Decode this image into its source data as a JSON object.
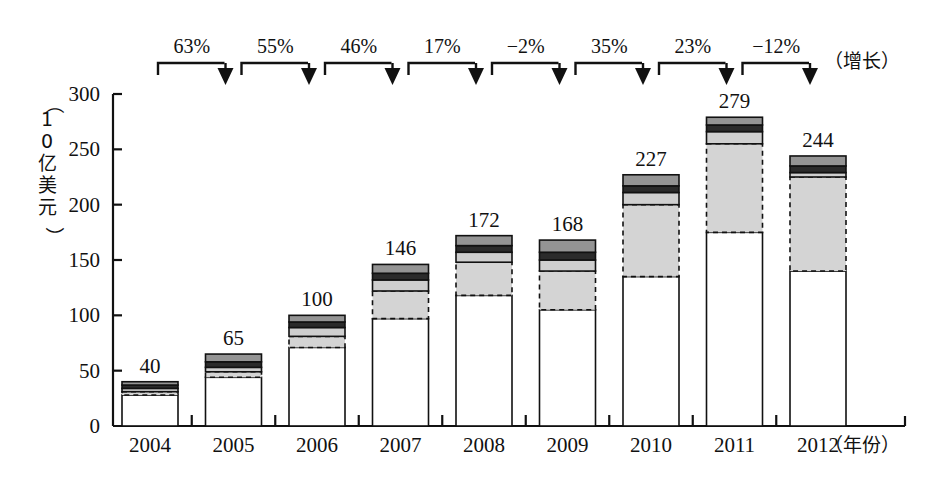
{
  "chart_data": {
    "type": "bar",
    "stacked": true,
    "title": "",
    "xlabel": "（年份）",
    "ylabel": "（10亿美元）",
    "categories": [
      "2004",
      "2005",
      "2006",
      "2007",
      "2008",
      "2009",
      "2010",
      "2011",
      "2012"
    ],
    "totals": [
      40,
      65,
      100,
      146,
      172,
      168,
      227,
      279,
      244
    ],
    "ylim": [
      0,
      300
    ],
    "yticks": [
      0,
      50,
      100,
      150,
      200,
      250,
      300
    ],
    "ytick_labels": [
      "0",
      "50",
      "100",
      "150",
      "200",
      "250",
      "300"
    ],
    "grid": false,
    "legend": "none",
    "series": [
      {
        "name": "segment-1-white-base",
        "fill": "#ffffff",
        "border": "solid",
        "values": [
          28,
          44,
          71,
          97,
          118,
          105,
          135,
          175,
          140
        ]
      },
      {
        "name": "segment-2-light-gray-dashed",
        "fill": "#d4d4d4",
        "border": "dashed",
        "values": [
          3,
          5,
          10,
          25,
          30,
          35,
          65,
          80,
          85
        ]
      },
      {
        "name": "segment-3-pale-band",
        "fill": "#cfcfcf",
        "border": "solid",
        "values": [
          3,
          4,
          8,
          10,
          9,
          10,
          11,
          11,
          4
        ]
      },
      {
        "name": "segment-4-dark-band",
        "fill": "#2b2b2b",
        "border": "solid",
        "values": [
          3,
          5,
          5,
          6,
          6,
          7,
          6,
          6,
          6
        ]
      },
      {
        "name": "segment-5-medium-gray-top",
        "fill": "#949494",
        "border": "solid",
        "values": [
          3,
          7,
          6,
          8,
          9,
          11,
          10,
          7,
          9
        ]
      }
    ],
    "growth_label": "（增长）",
    "growth_annotations": [
      {
        "from": "2004",
        "to": "2005",
        "label": "63%"
      },
      {
        "from": "2005",
        "to": "2006",
        "label": "55%"
      },
      {
        "from": "2006",
        "to": "2007",
        "label": "46%"
      },
      {
        "from": "2007",
        "to": "2008",
        "label": "17%"
      },
      {
        "from": "2008",
        "to": "2009",
        "label": "−2%"
      },
      {
        "from": "2009",
        "to": "2010",
        "label": "35%"
      },
      {
        "from": "2010",
        "to": "2011",
        "label": "23%"
      },
      {
        "from": "2011",
        "to": "2012",
        "label": "−12%"
      }
    ],
    "colors": {
      "axis": "#111111",
      "base": "#ffffff",
      "light_gray": "#d4d4d4",
      "pale_band": "#cfcfcf",
      "dark_band": "#2b2b2b",
      "gray_top": "#949494"
    }
  }
}
